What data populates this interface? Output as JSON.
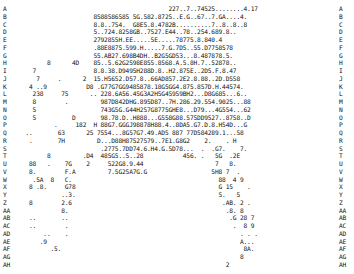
{
  "rows": [
    {
      "label": "A",
      "text": "                                              227..7..74525........4.17"
    },
    {
      "label": "B",
      "text": "                         8588586585 5G.582.8725..E.G..67..7.GA....4."
    },
    {
      "label": "C",
      "text": "                         8.8..754.  G8E5.8.4782B..........7..8..8..8"
    },
    {
      "label": "D",
      "text": "                         5..724.8258GB..7527.E44..78..254.689.8.."
    },
    {
      "label": "E",
      "text": "                         2792855H.EE.....5E.....78775.8.840.4"
    },
    {
      "label": "F",
      "text": "                         .88E8875.599.H.....7.G.7D5..55.D7758578"
    },
    {
      "label": "G",
      "text": "                         55.AB27.698B4DH..B2G5GD53...8.487878.5."
    },
    {
      "label": "H",
      "text": "            8      4D    85..5.62G2598E855.8568.A.5.8H.7..52878.."
    },
    {
      "label": "I",
      "text": "        7                8.8.38.D9495H288D.8..H2.875E..2D5.F.8.47"
    },
    {
      "label": "J",
      "text": "         7     .      2  15.H5652.D57.8..66AD857.2E2.8.88..2D.D558"
    },
    {
      "label": "K",
      "text": "       4 ..9           D8 .G77G7GG9485878.18G5GG4.875.857D.H.44574."
    },
    {
      "label": "L",
      "text": "        238     75      .. 228.6A56.45G3A2H5G45959BH2...D8G685...6.."
    },
    {
      "label": "M",
      "text": "        8        .         987D842DHG.895D87..7H.286.29.554.9025...88"
    },
    {
      "label": "N",
      "text": "        5                  743G5G.G44H257G8775GHE8...D79...4G554...62"
    },
    {
      "label": "O",
      "text": "        5          D       98.78.D..H888...G558G88.575DD9527..8758..D"
    },
    {
      "label": "P",
      "text": "              .     182  H 88G7.GGGJ98878H88.4..8DA5.G7.D.8.H54D...G"
    },
    {
      "label": "Q",
      "text": "      ..       63      25 7554...8G57G7.49.AD5 887 77D584289.1...58"
    },
    {
      "label": "R",
      "text": "       .       7H         D...D88H87527579..7E1.G8G2    2.    . H"
    },
    {
      "label": "S",
      "text": "                           .2775.7DD74.6.H4.G.5D78...  .  .G7.    7."
    },
    {
      "label": "T",
      "text": "            8         .D4  485G5..5..28           456. .   5G  .2E"
    },
    {
      "label": "U",
      "text": "       88   .    7G    2     522G8.9.44                    7   8."
    },
    {
      "label": "V",
      "text": "       8.        F.A         7.5G25A7G.G                  5H8 7  ."
    },
    {
      "label": "W",
      "text": "        .5A  8   C.                                         88  4 9"
    },
    {
      "label": "X",
      "text": "       8 .8.     G78                                        G 15    ."
    },
    {
      "label": "Y",
      "text": "                ..3.                                        5.   5"
    },
    {
      "label": "Z",
      "text": "       8        2.6                                          .AB. 2 ."
    },
    {
      "label": "AA",
      "text": "                8.                                            .8. 8"
    },
    {
      "label": "AB",
      "text": "       ..       ..                                             .G 28 7"
    },
    {
      "label": "AC",
      "text": "       ..        .                                              .  8 9"
    },
    {
      "label": "AD",
      "text": "           ..    .                                                . . ."
    },
    {
      "label": "AE",
      "text": "          .9                                                      A..."
    },
    {
      "label": "AF",
      "text": "             .5.                                                   8A."
    },
    {
      "label": "AG",
      "text": "                                                                  8"
    },
    {
      "label": "AH",
      "text": "                                                              2"
    }
  ]
}
